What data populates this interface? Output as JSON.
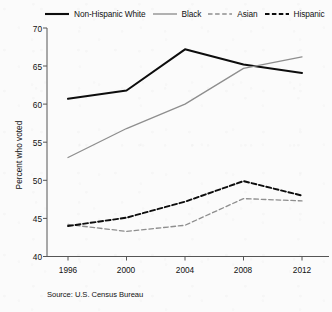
{
  "chart_data": {
    "type": "line",
    "title": "",
    "xlabel": "",
    "ylabel": "Percent who voted",
    "categories": [
      "1996",
      "2000",
      "2004",
      "2008",
      "2012"
    ],
    "x": [
      1996,
      2000,
      2004,
      2008,
      2012
    ],
    "xlim": [
      1994.6,
      2013.6
    ],
    "ylim": [
      40,
      70
    ],
    "yticks": [
      40,
      45,
      50,
      55,
      60,
      65,
      70
    ],
    "xticks": [
      "1996",
      "2000",
      "2004",
      "2008",
      "2012"
    ],
    "grid": false,
    "legend_position": "top",
    "source": "Source: U.S. Census Bureau",
    "series": [
      {
        "name": "Non-Hispanic White",
        "values": [
          60.7,
          61.8,
          67.2,
          65.2,
          64.1
        ],
        "color": "#0d0d0d",
        "style": "solid",
        "width": 2.0
      },
      {
        "name": "Black",
        "values": [
          53.0,
          56.8,
          60.0,
          64.7,
          66.2
        ],
        "color": "#8e8e8e",
        "style": "solid",
        "width": 1.3
      },
      {
        "name": "Asian",
        "values": [
          44.2,
          43.3,
          44.1,
          47.6,
          47.3
        ],
        "color": "#8e8e8e",
        "style": "dashed",
        "width": 1.3
      },
      {
        "name": "Hispanic",
        "values": [
          44.0,
          45.1,
          47.2,
          49.9,
          48.0
        ],
        "color": "#0d0d0d",
        "style": "dashed",
        "width": 1.9
      }
    ]
  },
  "axis": {
    "y_tick_labels": [
      "70",
      "65",
      "60",
      "55",
      "50",
      "45",
      "40"
    ],
    "x_tick_labels": [
      "1996",
      "2000",
      "2004",
      "2008",
      "2012"
    ],
    "y_axis_title": "Percent who voted"
  },
  "legend": {
    "items": [
      {
        "label": "Non-Hispanic White"
      },
      {
        "label": "Black"
      },
      {
        "label": "Asian"
      },
      {
        "label": "Hispanic"
      }
    ]
  },
  "footer": {
    "source": "Source: U.S. Census Bureau"
  }
}
